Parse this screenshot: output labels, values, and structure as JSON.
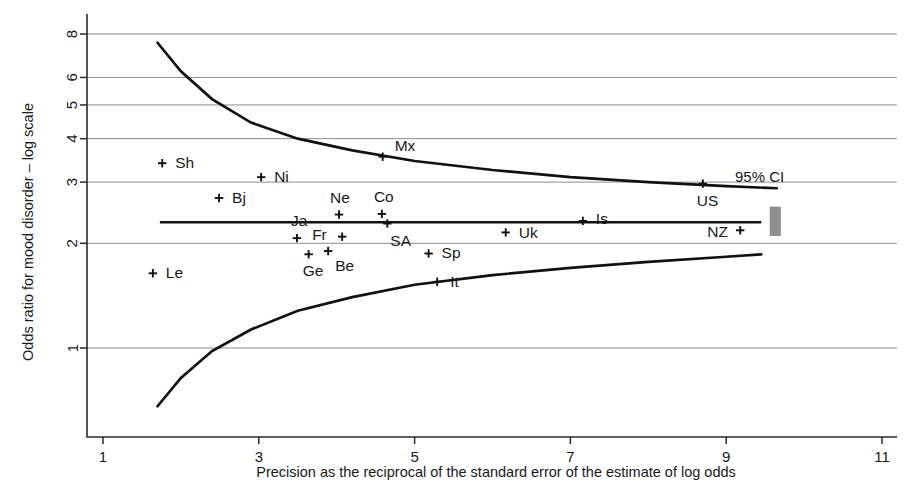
{
  "chart_data": {
    "type": "scatter",
    "title": "",
    "subtitle": "",
    "xlabel": "Precision as the reciprocal of the standard error of the estimate of log odds",
    "ylabel": "Odds ratio for mood disorder – log scale",
    "yscale": "log",
    "xscale": "linear",
    "xlim": [
      0.6,
      11.4
    ],
    "ylim": [
      0.62,
      9.0
    ],
    "xticks": [
      1,
      3,
      5,
      7,
      9,
      11
    ],
    "xtick_labels": [
      "1",
      "3",
      "5",
      "7",
      "9",
      "11"
    ],
    "yticks": [
      1,
      2,
      3,
      4,
      5,
      6,
      8
    ],
    "ytick_labels": [
      "1",
      "2",
      "3",
      "4",
      "5",
      "6",
      "8"
    ],
    "grid": "horizontal",
    "legend": "none",
    "points": [
      {
        "label": "Sh",
        "x": 1.76,
        "y": 3.4,
        "label_dx": 13,
        "label_dy": 5
      },
      {
        "label": "Le",
        "x": 1.64,
        "y": 1.64,
        "label_dx": 13,
        "label_dy": 5
      },
      {
        "label": "Bj",
        "x": 2.49,
        "y": 2.7,
        "label_dx": 13,
        "label_dy": 5
      },
      {
        "label": "Ni",
        "x": 3.03,
        "y": 3.1,
        "label_dx": 13,
        "label_dy": 5
      },
      {
        "label": "Ja",
        "x": 3.49,
        "y": 2.07,
        "label_dx": -6,
        "label_dy": -12
      },
      {
        "label": "Ge",
        "x": 3.64,
        "y": 1.86,
        "label_dx": -6,
        "label_dy": 22
      },
      {
        "label": "Be",
        "x": 3.89,
        "y": 1.9,
        "label_dx": 7,
        "label_dy": 20
      },
      {
        "label": "Fr",
        "x": 4.07,
        "y": 2.09,
        "label_dx": -30,
        "label_dy": 3
      },
      {
        "label": "Ne",
        "x": 4.03,
        "y": 2.42,
        "label_dx": -9,
        "label_dy": -12
      },
      {
        "label": "Mx",
        "x": 4.59,
        "y": 3.55,
        "label_dx": 12,
        "label_dy": -6
      },
      {
        "label": "Co",
        "x": 4.58,
        "y": 2.43,
        "label_dx": -8,
        "label_dy": -12
      },
      {
        "label": "SA",
        "x": 4.65,
        "y": 2.28,
        "label_dx": 3,
        "label_dy": 22
      },
      {
        "label": "Sp",
        "x": 5.18,
        "y": 1.87,
        "label_dx": 13,
        "label_dy": 5
      },
      {
        "label": "It",
        "x": 5.29,
        "y": 1.55,
        "label_dx": 13,
        "label_dy": 5
      },
      {
        "label": "Uk",
        "x": 6.17,
        "y": 2.15,
        "label_dx": 13,
        "label_dy": 6
      },
      {
        "label": "Is",
        "x": 7.16,
        "y": 2.32,
        "label_dx": 13,
        "label_dy": 3
      },
      {
        "label": "US",
        "x": 8.7,
        "y": 2.97,
        "label_dx": -6,
        "label_dy": 22
      },
      {
        "label": "NZ",
        "x": 9.18,
        "y": 2.18,
        "label_dx": -33,
        "label_dy": 7
      }
    ],
    "pooled_line": {
      "value": 2.3,
      "x_start": 1.73,
      "x_end": 9.45
    },
    "ci_band": {
      "caption": "95% CI",
      "upper": [
        {
          "x": 1.7,
          "y": 7.55
        },
        {
          "x": 2.0,
          "y": 6.25
        },
        {
          "x": 2.4,
          "y": 5.2
        },
        {
          "x": 2.9,
          "y": 4.45
        },
        {
          "x": 3.5,
          "y": 4.0
        },
        {
          "x": 4.2,
          "y": 3.7
        },
        {
          "x": 5.0,
          "y": 3.45
        },
        {
          "x": 6.0,
          "y": 3.25
        },
        {
          "x": 7.0,
          "y": 3.1
        },
        {
          "x": 8.0,
          "y": 3.0
        },
        {
          "x": 9.0,
          "y": 2.92
        },
        {
          "x": 9.65,
          "y": 2.88
        }
      ],
      "lower": [
        {
          "x": 1.7,
          "y": 0.68
        },
        {
          "x": 2.0,
          "y": 0.82
        },
        {
          "x": 2.4,
          "y": 0.98
        },
        {
          "x": 2.9,
          "y": 1.13
        },
        {
          "x": 3.5,
          "y": 1.28
        },
        {
          "x": 4.2,
          "y": 1.4
        },
        {
          "x": 5.0,
          "y": 1.52
        },
        {
          "x": 6.0,
          "y": 1.62
        },
        {
          "x": 7.0,
          "y": 1.7
        },
        {
          "x": 8.0,
          "y": 1.77
        },
        {
          "x": 9.0,
          "y": 1.83
        },
        {
          "x": 9.45,
          "y": 1.86
        }
      ]
    },
    "swatch": {
      "x": 9.63,
      "y_top": 2.55,
      "y_bottom": 2.1,
      "color": "#8e8e8e"
    }
  },
  "annotations": {
    "ci_caption": "95% CI"
  }
}
